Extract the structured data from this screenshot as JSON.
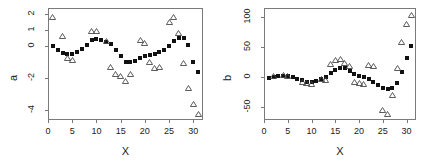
{
  "figure": {
    "panels": [
      "a",
      "b"
    ],
    "marker_fitted": "filled-square",
    "marker_observed": "open-triangle",
    "color_fitted": "#111111",
    "color_observed": "#555555",
    "frame_color": "#7a7a7a"
  },
  "chart_data": [
    {
      "type": "scatter",
      "panel_id": "a",
      "title": "",
      "xlabel": "X",
      "ylabel": "a",
      "xlim": [
        0,
        32
      ],
      "ylim": [
        -4.6,
        2.4
      ],
      "xticks": [
        0,
        5,
        10,
        15,
        20,
        25,
        30
      ],
      "yticks": [
        2,
        1,
        0,
        -2,
        -4
      ],
      "xtick_labels": [
        "0",
        "5",
        "10",
        "15",
        "20",
        "25",
        "30"
      ],
      "ytick_labels": [
        "2",
        "1",
        "0",
        "-2",
        "-4"
      ],
      "grid": false,
      "legend": "none",
      "series": [
        {
          "name": "fitted",
          "marker": "filled-square",
          "x": [
            1,
            2,
            3,
            4,
            5,
            6,
            7,
            8,
            9,
            10,
            11,
            12,
            13,
            14,
            15,
            16,
            17,
            18,
            19,
            20,
            21,
            22,
            23,
            24,
            25,
            26,
            27,
            28,
            29,
            30,
            31
          ],
          "y": [
            0.05,
            -0.2,
            -0.42,
            -0.5,
            -0.48,
            -0.36,
            -0.18,
            0.1,
            0.38,
            0.45,
            0.42,
            0.3,
            0.12,
            -0.2,
            -0.62,
            -0.95,
            -1.0,
            -0.9,
            -0.72,
            -0.6,
            -0.52,
            -0.45,
            -0.35,
            -0.2,
            0.05,
            0.35,
            0.55,
            0.5,
            0.1,
            -1.0,
            -1.6,
            -2.3
          ]
        },
        {
          "name": "observed",
          "marker": "open-triangle",
          "x": [
            1,
            3,
            4,
            5,
            9,
            10,
            12,
            13,
            14,
            15,
            16,
            17,
            19,
            20,
            21,
            22,
            23,
            25,
            26,
            27,
            28,
            29,
            30,
            31
          ],
          "y": [
            1.85,
            0.62,
            -0.72,
            -0.85,
            0.95,
            0.98,
            0.35,
            -1.28,
            -1.72,
            -1.88,
            -2.18,
            -1.75,
            0.42,
            0.22,
            -0.95,
            -1.35,
            -1.3,
            1.55,
            1.82,
            0.85,
            -1.05,
            -2.6,
            -3.6,
            -4.2
          ]
        }
      ]
    },
    {
      "type": "scatter",
      "panel_id": "b",
      "title": "",
      "xlabel": "X",
      "ylabel": "b",
      "xlim": [
        0,
        32
      ],
      "ylim": [
        -72,
        115
      ],
      "xticks": [
        0,
        5,
        10,
        15,
        20,
        25,
        30
      ],
      "yticks": [
        100,
        50,
        0,
        -50
      ],
      "xtick_labels": [
        "0",
        "5",
        "10",
        "15",
        "20",
        "25",
        "30"
      ],
      "ytick_labels": [
        "100",
        "50",
        "0",
        "-50"
      ],
      "grid": false,
      "legend": "none",
      "series": [
        {
          "name": "fitted",
          "marker": "filled-square",
          "x": [
            1,
            2,
            3,
            4,
            5,
            6,
            7,
            8,
            9,
            10,
            11,
            12,
            13,
            14,
            15,
            16,
            17,
            18,
            19,
            20,
            21,
            22,
            23,
            24,
            25,
            26,
            27,
            28,
            29,
            30,
            31
          ],
          "y": [
            -2,
            0,
            1,
            2,
            2,
            0,
            -3,
            -6,
            -8,
            -9,
            -7,
            -4,
            0,
            6,
            12,
            15,
            14,
            10,
            5,
            2,
            0,
            -3,
            -8,
            -14,
            -18,
            -20,
            -19,
            -10,
            8,
            32,
            52
          ]
        },
        {
          "name": "observed",
          "marker": "open-triangle",
          "x": [
            2,
            4,
            5,
            8,
            9,
            10,
            12,
            13,
            14,
            15,
            16,
            17,
            18,
            19,
            20,
            21,
            22,
            23,
            25,
            26,
            27,
            28,
            29,
            30,
            31
          ],
          "y": [
            1,
            3,
            2,
            -8,
            -11,
            -12,
            -4,
            -6,
            22,
            28,
            30,
            24,
            18,
            -8,
            -10,
            -12,
            20,
            18,
            -56,
            -62,
            -30,
            14,
            58,
            88,
            104
          ]
        }
      ]
    }
  ]
}
